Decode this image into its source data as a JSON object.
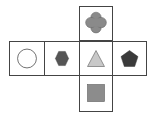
{
  "diagram": {
    "type": "cube-net",
    "faces": [
      {
        "id": "top",
        "shape": "quatrefoil",
        "fill": "#8a8a8a"
      },
      {
        "id": "left-outer",
        "shape": "circle",
        "fill": "#ffffff"
      },
      {
        "id": "left-inner",
        "shape": "hexagon",
        "fill": "#555555"
      },
      {
        "id": "center",
        "shape": "triangle",
        "fill": "#c8c8c8"
      },
      {
        "id": "right",
        "shape": "pentagon",
        "fill": "#3a3a3a"
      },
      {
        "id": "bottom",
        "shape": "square",
        "fill": "#8c8c8c"
      }
    ]
  }
}
